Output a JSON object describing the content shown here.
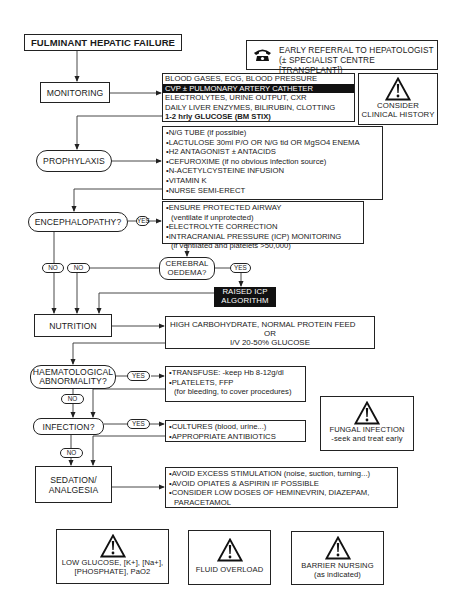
{
  "title": "FULMINANT HEPATIC FAILURE",
  "referral": {
    "icon": "telephone-icon",
    "line1": "EARLY REFERRAL TO HEPATOLOGIST",
    "line2": "(± SPECIALIST CENTRE [TRANSPLANT])"
  },
  "monitoring": {
    "label": "MONITORING",
    "items": [
      "BLOOD GASES, ECG, BLOOD PRESSURE",
      "CVP ± PULMONARY ARTERY CATHETER",
      "ELECTROLYTES, URINE OUTPUT, CXR",
      "DAILY LIVER ENZYMES, BILIRUBIN, CLOTTING",
      "1-2 hrly GLUCOSE (BM STIX)"
    ]
  },
  "clinical_history": {
    "icon": "warning-icon",
    "line1": "CONSIDER",
    "line2": "CLINICAL HISTORY"
  },
  "prophylaxis": {
    "label": "PROPHYLAXIS",
    "items": [
      "N/G TUBE (if possible)",
      "LACTULOSE 30ml P/O OR N/G tid OR MgSO4 ENEMA",
      "H2 ANTAGONIST ± ANTACIDS",
      "CEFUROXIME (if no obvious infection source)",
      "N-ACETYLCYSTEINE INFUSION",
      "VITAMIN K",
      "NURSE SEMI-ERECT"
    ]
  },
  "encephalopathy": {
    "label": "ENCEPHALOPATHY?",
    "yes": "YES",
    "no_left": "NO",
    "no_right": "NO",
    "items": [
      "ENSURE PROTECTED AIRWAY",
      "(ventilate if unprotected)",
      "ELECTROLYTE CORRECTION",
      "INTRACRANIAL PRESSURE (ICP) MONITORING",
      "(if ventilated and platelets >50,000)"
    ]
  },
  "cerebral_oedema": {
    "line1": "CEREBRAL",
    "line2": "OEDEMA?",
    "yes": "YES"
  },
  "raised_icp": {
    "line1": "RAISED ICP",
    "line2": "ALGORITHM"
  },
  "nutrition": {
    "label": "NUTRITION",
    "line1": "HIGH CARBOHYDRATE, NORMAL PROTEIN FEED",
    "line2": "OR",
    "line3": "I/V 20-50% GLUCOSE"
  },
  "haematological": {
    "line1": "HAEMATOLOGICAL",
    "line2": "ABNORMALITY?",
    "yes": "YES",
    "no": "NO",
    "items": [
      "TRANSFUSE:  -keep Hb 8-12g/dl",
      "PLATELETS, FFP",
      "(for bleeding, to cover procedures)"
    ]
  },
  "infection": {
    "label": "INFECTION?",
    "yes": "YES",
    "no": "NO",
    "items": [
      "CULTURES (blood, urine...)",
      "APPROPRIATE ANTIBIOTICS"
    ]
  },
  "fungal": {
    "icon": "warning-icon",
    "line1": "FUNGAL INFECTION",
    "line2": "-seek and treat early"
  },
  "sedation": {
    "line1": "SEDATION/",
    "line2": "ANALGESIA",
    "items": [
      "AVOID EXCESS STIMULATION (noise, suction, turning...)",
      "AVOID OPIATES & ASPIRIN IF POSSIBLE",
      "CONSIDER LOW DOSES OF HEMINEVRIN, DIAZEPAM,",
      "PARACETAMOL"
    ]
  },
  "warnings": [
    {
      "icon": "warning-icon",
      "line1": "LOW GLUCOSE, [K+], [Na+],",
      "line2": "[PHOSPHATE], PaO2"
    },
    {
      "icon": "warning-icon",
      "line1": "FLUID OVERLOAD",
      "line2": ""
    },
    {
      "icon": "warning-icon",
      "line1": "BARRIER NURSING",
      "line2": "(as indicated)"
    }
  ],
  "colors": {
    "ink": "#1a1a1a",
    "background": "#ffffff",
    "highlight_bg": "#111111",
    "highlight_text": "#ffffff"
  }
}
